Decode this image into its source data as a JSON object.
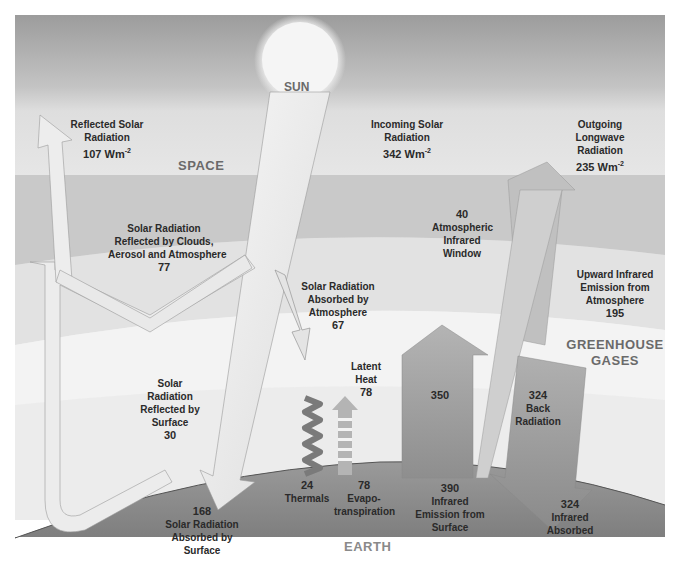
{
  "diagram": {
    "regions": {
      "space": "SPACE",
      "sun": "SUN",
      "greenhouse_1": "GREENHOUSE",
      "greenhouse_2": "GASES",
      "earth": "EARTH"
    },
    "flows": {
      "reflected_solar": {
        "l1": "Reflected Solar",
        "l2": "Radiation",
        "value": "107 Wm",
        "unit_sup": "-2"
      },
      "incoming_solar": {
        "l1": "Incoming Solar",
        "l2": "Radiation",
        "value": "342 Wm",
        "unit_sup": "-2"
      },
      "outgoing_longwave": {
        "l1": "Outgoing",
        "l2": "Longwave",
        "l3": "Radiation",
        "value": "235 Wm",
        "unit_sup": "-2"
      },
      "reflected_clouds": {
        "l1": "Solar Radiation",
        "l2": "Reflected by Clouds,",
        "l3": "Aerosol and Atmosphere",
        "value": "77"
      },
      "atm_window": {
        "value": "40",
        "l1": "Atmospheric",
        "l2": "Infrared",
        "l3": "Window"
      },
      "upward_ir_atm": {
        "l1": "Upward Infrared",
        "l2": "Emission from",
        "l3": "Atmosphere",
        "value": "195"
      },
      "absorbed_atm": {
        "l1": "Solar Radiation",
        "l2": "Absorbed by",
        "l3": "Atmosphere",
        "value": "67"
      },
      "latent_heat": {
        "l1": "Latent",
        "l2": "Heat",
        "value": "78"
      },
      "surface_ir_350": {
        "value": "350"
      },
      "back_radiation": {
        "value": "324",
        "l1": "Back",
        "l2": "Radiation"
      },
      "reflected_surface": {
        "l1": "Solar",
        "l2": "Radiation",
        "l3": "Reflected by",
        "l4": "Surface",
        "value": "30"
      },
      "thermals": {
        "value": "24",
        "l1": "Thermals"
      },
      "evapotranspiration": {
        "value": "78",
        "l1": "Evapo-",
        "l2": "transpiration"
      },
      "surface_emission": {
        "value": "390",
        "l1": "Infrared",
        "l2": "Emission from",
        "l3": "Surface"
      },
      "ir_absorbed": {
        "value": "324",
        "l1": "Infrared",
        "l2": "Absorbed"
      },
      "absorbed_surface": {
        "value": "168",
        "l1": "Solar Radiation",
        "l2": "Absorbed by",
        "l3": "Surface"
      }
    },
    "colors": {
      "space_top": "#9a9a9a",
      "space_bottom": "#d6d6d6",
      "atmosphere": "#f4f4f4",
      "earth": "#8f8f8f",
      "solar_arrow": "#ececec",
      "ir_arrow": "#a6a6a6",
      "text": "#2a2a2a",
      "region_text": "#6a6a6a"
    }
  }
}
